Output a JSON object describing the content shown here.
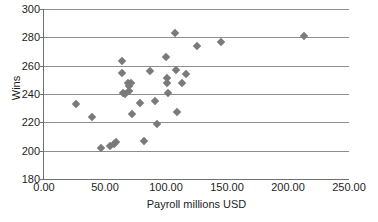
{
  "chart_data": {
    "type": "scatter",
    "title": "",
    "xlabel": "Payroll millions USD",
    "ylabel": "Wins",
    "xlim": [
      0,
      250
    ],
    "ylim": [
      180,
      300
    ],
    "xticks": [
      "0.00",
      "50.00",
      "100.00",
      "150.00",
      "200.00",
      "250.00"
    ],
    "xtick_values": [
      0,
      50,
      100,
      150,
      200,
      250
    ],
    "yticks": [
      "180",
      "200",
      "220",
      "240",
      "260",
      "280",
      "300"
    ],
    "ytick_values": [
      180,
      200,
      220,
      240,
      260,
      280,
      300
    ],
    "grid": "horizontal",
    "legend": "none",
    "marker": "diamond",
    "marker_color": "#7a7a7a",
    "points": [
      {
        "x": 26,
        "y": 233
      },
      {
        "x": 39,
        "y": 224
      },
      {
        "x": 47,
        "y": 202
      },
      {
        "x": 54,
        "y": 203
      },
      {
        "x": 57,
        "y": 205
      },
      {
        "x": 59,
        "y": 206
      },
      {
        "x": 64,
        "y": 263
      },
      {
        "x": 64,
        "y": 255
      },
      {
        "x": 65,
        "y": 241
      },
      {
        "x": 66,
        "y": 240
      },
      {
        "x": 69,
        "y": 248
      },
      {
        "x": 70,
        "y": 246
      },
      {
        "x": 70,
        "y": 242
      },
      {
        "x": 71,
        "y": 248
      },
      {
        "x": 72,
        "y": 226
      },
      {
        "x": 79,
        "y": 234
      },
      {
        "x": 82,
        "y": 207
      },
      {
        "x": 87,
        "y": 256
      },
      {
        "x": 91,
        "y": 235
      },
      {
        "x": 93,
        "y": 219
      },
      {
        "x": 100,
        "y": 266
      },
      {
        "x": 101,
        "y": 251
      },
      {
        "x": 101,
        "y": 248
      },
      {
        "x": 102,
        "y": 241
      },
      {
        "x": 107,
        "y": 283
      },
      {
        "x": 108,
        "y": 257
      },
      {
        "x": 109,
        "y": 227
      },
      {
        "x": 113,
        "y": 248
      },
      {
        "x": 116,
        "y": 254
      },
      {
        "x": 125,
        "y": 274
      },
      {
        "x": 145,
        "y": 277
      },
      {
        "x": 213,
        "y": 281
      }
    ]
  }
}
